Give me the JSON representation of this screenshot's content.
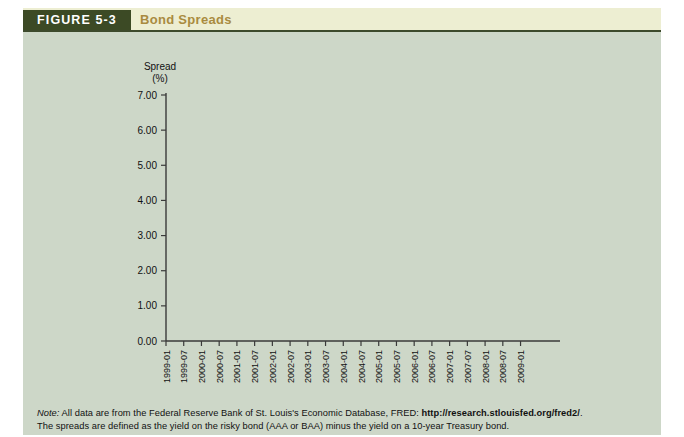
{
  "figure": {
    "tag": "FIGURE 5-3",
    "title": "Bond Spreads",
    "tag_bg": "#3c4a25",
    "title_color": "#a98b3f",
    "body_bg": "#cdd7c8"
  },
  "note": {
    "label": "Note:",
    "line1_before_url": "All data are from the Federal Reserve Bank of St. Louis's Economic Database, FRED:",
    "url": "http://research.stlouisfed.org/fred2/",
    "line1_after_url": ".",
    "line2": "The spreads are defined as the yield on the risky bond (AAA or BAA) minus the yield on a 10-year Treasury bond."
  },
  "chart_data": {
    "type": "line",
    "title": "Bond Spreads",
    "xlabel": "",
    "ylabel": "Spread\n(%)",
    "ylabel_line1": "Spread",
    "ylabel_line2": "(%)",
    "ylim": [
      0.0,
      7.0
    ],
    "ytick_values": [
      0.0,
      1.0,
      2.0,
      3.0,
      4.0,
      5.0,
      6.0,
      7.0
    ],
    "ytick_labels": [
      "0.00",
      "1.00",
      "2.00",
      "3.00",
      "4.00",
      "5.00",
      "6.00",
      "7.00"
    ],
    "grid": false,
    "legend_position": "inline-annotations",
    "xtick_labels": [
      "1999-01",
      "1999-07",
      "2000-01",
      "2000-07",
      "2001-01",
      "2001-07",
      "2002-01",
      "2002-07",
      "2003-01",
      "2003-07",
      "2004-01",
      "2004-07",
      "2005-01",
      "2005-07",
      "2006-01",
      "2006-07",
      "2007-01",
      "2007-07",
      "2008-01",
      "2008-07",
      "2009-01"
    ],
    "x_start": "1999-01",
    "x_end": "2009-02",
    "annotations": [
      {
        "text": "BAA – T-bond",
        "target_series": "BAA - T-bond"
      },
      {
        "text": "AAA – T-bond",
        "target_series": "AAA - T-bond"
      }
    ],
    "series": [
      {
        "name": "BAA - T-bond",
        "color": "#6b3b3b",
        "values": [
          2.55,
          2.42,
          2.28,
          2.18,
          2.12,
          2.05,
          1.98,
          1.95,
          1.92,
          1.9,
          1.92,
          1.95,
          2.02,
          2.06,
          2.0,
          1.9,
          1.85,
          1.88,
          1.9,
          1.95,
          1.98,
          2.02,
          2.12,
          2.22,
          2.45,
          2.35,
          2.12,
          1.9,
          1.78,
          1.75,
          1.8,
          1.95,
          2.12,
          2.28,
          2.42,
          2.55,
          2.62,
          2.58,
          2.72,
          2.68,
          2.8,
          2.75,
          2.85,
          2.78,
          2.95,
          3.02,
          2.88,
          2.72,
          2.85,
          2.92,
          3.02,
          3.32,
          3.55,
          3.88,
          3.55,
          3.32,
          3.2,
          3.08,
          3.05,
          2.95,
          2.85,
          2.75,
          2.7,
          2.62,
          2.52,
          2.42,
          2.4,
          2.32,
          2.42,
          2.38,
          2.3,
          2.25,
          2.22,
          2.25,
          2.22,
          2.12,
          2.02,
          1.95,
          1.92,
          1.9,
          1.95,
          1.92,
          1.88,
          1.85,
          1.82,
          1.8,
          1.78,
          1.8,
          1.82,
          1.8,
          1.78,
          1.75,
          1.78,
          1.8,
          1.78,
          1.75,
          1.72,
          1.74,
          1.76,
          1.78,
          1.76,
          1.74,
          1.76,
          1.78,
          1.8,
          1.82,
          1.8,
          1.78,
          1.8,
          1.85,
          1.95,
          2.08,
          2.02,
          1.95,
          2.1,
          2.25,
          2.55,
          2.72,
          2.9,
          3.12,
          3.35,
          3.28,
          3.12,
          3.3,
          3.28,
          3.18,
          3.3,
          3.35,
          3.85,
          4.95,
          6.18,
          5.85,
          5.52
        ]
      },
      {
        "name": "AAA - T-bond",
        "color": "#46698f",
        "values": [
          1.52,
          1.48,
          1.42,
          1.38,
          1.35,
          1.32,
          1.35,
          1.4,
          1.38,
          1.32,
          1.36,
          1.42,
          1.45,
          1.42,
          1.38,
          1.32,
          1.28,
          1.3,
          1.32,
          1.35,
          1.32,
          1.28,
          1.22,
          1.18,
          1.2,
          1.15,
          1.05,
          0.95,
          0.88,
          0.92,
          1.02,
          1.15,
          1.28,
          1.4,
          1.45,
          1.42,
          1.48,
          1.45,
          1.52,
          1.58,
          1.65,
          1.62,
          1.72,
          1.8,
          1.88,
          1.82,
          1.75,
          1.68,
          1.72,
          1.78,
          1.82,
          1.95,
          2.08,
          2.22,
          2.05,
          1.92,
          1.85,
          1.78,
          1.72,
          1.68,
          1.62,
          1.58,
          1.62,
          1.58,
          1.55,
          1.52,
          1.55,
          1.52,
          1.48,
          1.45,
          1.48,
          1.45,
          1.42,
          1.38,
          1.35,
          1.32,
          1.28,
          1.25,
          1.22,
          1.2,
          1.22,
          1.2,
          1.18,
          1.15,
          1.12,
          1.1,
          1.08,
          1.06,
          1.04,
          1.02,
          1.0,
          0.98,
          1.0,
          1.02,
          1.0,
          0.98,
          0.96,
          0.95,
          0.96,
          0.98,
          0.96,
          0.94,
          0.96,
          0.98,
          1.0,
          1.02,
          1.0,
          0.98,
          0.95,
          0.92,
          0.88,
          0.95,
          1.05,
          1.0,
          1.08,
          1.18,
          1.32,
          1.42,
          1.48,
          1.55,
          1.72,
          1.65,
          1.55,
          1.7,
          1.85,
          1.78,
          1.9,
          2.02,
          2.2,
          2.55,
          2.78,
          2.72,
          2.58
        ]
      }
    ]
  }
}
